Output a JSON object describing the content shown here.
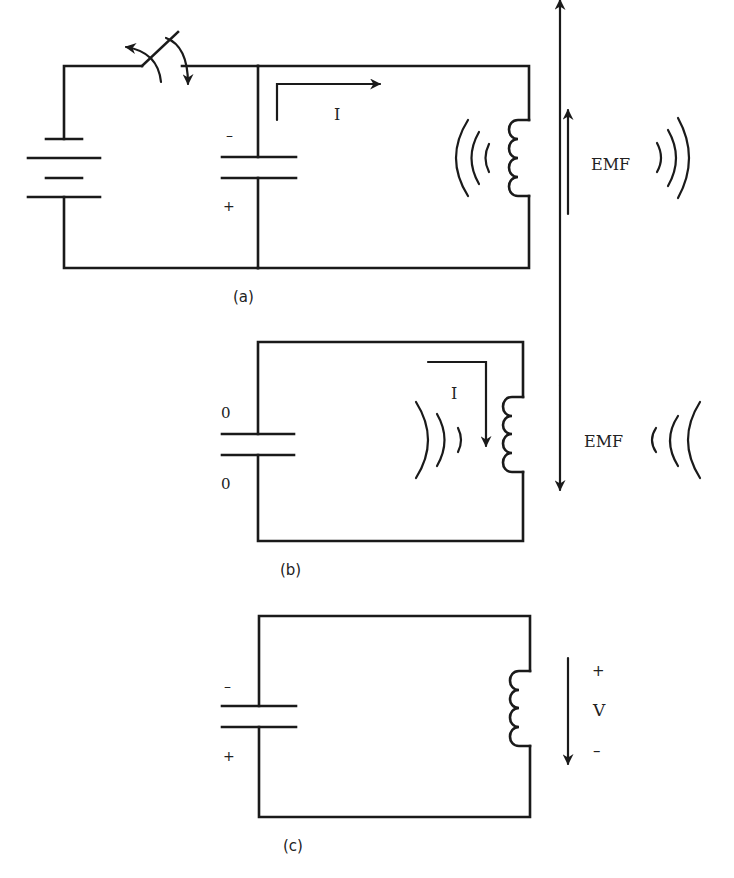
{
  "figure": {
    "panels": [
      {
        "id": "a",
        "caption": "(a)",
        "capacitor_top_sign": "–",
        "capacitor_bottom_sign": "+",
        "current_label": "I",
        "emf_label": "EMF",
        "emf_direction": "up"
      },
      {
        "id": "b",
        "caption": "(b)",
        "capacitor_top_label": "0",
        "capacitor_bottom_label": "0",
        "current_label": "I",
        "emf_label": "EMF",
        "emf_direction": "down"
      },
      {
        "id": "c",
        "caption": "(c)",
        "capacitor_top_sign": "–",
        "capacitor_bottom_sign": "+",
        "voltage_top_sign": "+",
        "voltage_label": "V",
        "voltage_bottom_sign": "–",
        "voltage_direction": "down"
      }
    ]
  },
  "colors": {
    "ink": "#1a1a1a",
    "background": "#ffffff"
  }
}
